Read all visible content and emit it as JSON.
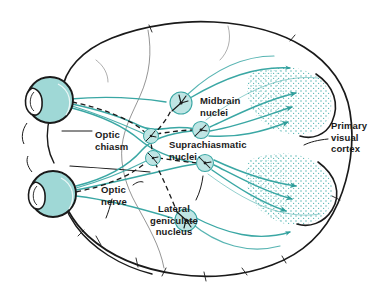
{
  "figure": {
    "background_color": "#ffffff",
    "outline_color": "#1a1a1a",
    "pathway_color": "#3aa7a4",
    "eye_fill_color": "#9fd8d6",
    "nucleus_fill_color": "#bfe5e4",
    "cortex_stipple_color": "#4fb3b0",
    "text_color": "#1a1a1a"
  },
  "labels": [
    {
      "id": "midbrain-nuclei",
      "lines": [
        "Midbrain",
        "nuclei"
      ],
      "text": "Midbrain\nnuclei",
      "align": "left",
      "x": 200,
      "y": 95
    },
    {
      "id": "optic-chiasm",
      "lines": [
        "Optic",
        "chiasm"
      ],
      "text": "Optic\nchiasm",
      "align": "left",
      "x": 95,
      "y": 129
    },
    {
      "id": "suprachiasmatic-nuclei",
      "lines": [
        "Suprachiasmatic",
        "nuclei"
      ],
      "text": "Suprachiasmatic\nnuclei",
      "align": "left",
      "x": 169,
      "y": 139
    },
    {
      "id": "primary-visual-cortex",
      "lines": [
        "Primary",
        "visual",
        "cortex"
      ],
      "text": "Primary\nvisual\ncortex",
      "align": "left",
      "x": 331,
      "y": 120
    },
    {
      "id": "optic-nerve",
      "lines": [
        "Optic",
        "nerve"
      ],
      "text": "Optic\nnerve",
      "align": "left",
      "x": 101,
      "y": 184
    },
    {
      "id": "lateral-geniculate-nucleus",
      "lines": [
        "Lateral",
        "geniculate",
        "nucleus"
      ],
      "text": "Lateral\ngeniculate\nnucleus",
      "align": "center",
      "x": 138,
      "y": 203
    }
  ],
  "anatomy": {
    "eyes": [
      {
        "id": "upper-eye",
        "cx": 50,
        "cy": 100,
        "r": 23
      },
      {
        "id": "lower-eye",
        "cx": 53,
        "cy": 194,
        "r": 23
      }
    ],
    "nuclei": [
      {
        "id": "midbrain-nucleus-upper",
        "cx": 181,
        "cy": 103,
        "r": 11
      },
      {
        "id": "midbrain-nucleus-lower",
        "cx": 186,
        "cy": 220,
        "r": 11
      },
      {
        "id": "suprachiasmatic-nucleus-upper",
        "cx": 151,
        "cy": 136,
        "r": 7.5
      },
      {
        "id": "suprachiasmatic-nucleus-lower",
        "cx": 153,
        "cy": 158,
        "r": 7.5
      },
      {
        "id": "lgn-upper",
        "cx": 201,
        "cy": 130,
        "r": 8.5
      },
      {
        "id": "lgn-lower",
        "cx": 205,
        "cy": 163,
        "r": 8.5
      }
    ],
    "cortex_regions": [
      {
        "id": "primary-visual-cortex-upper",
        "arrows": 3
      },
      {
        "id": "primary-visual-cortex-lower",
        "arrows": 3
      }
    ]
  }
}
